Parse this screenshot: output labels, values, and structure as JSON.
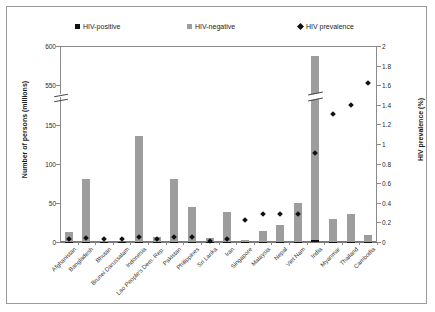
{
  "legend": [
    {
      "label": "HIV-positive",
      "marker": "square-black",
      "color": "#111111"
    },
    {
      "label": "HIV-negative",
      "marker": "square-grey",
      "color": "#9d9d9d"
    },
    {
      "label": "HIV prevalence",
      "marker": "diamond-black",
      "color": "#111111"
    }
  ],
  "axes": {
    "left_title": "Number of persons (millions)",
    "right_title": "HIV prevalence (%)",
    "left_ticks": [
      "0",
      "50",
      "100",
      "150",
      "550",
      "600"
    ],
    "right_ticks": [
      "0",
      "0.2",
      "0.4",
      "0.6",
      "0.8",
      "1",
      "1.2",
      "1.4",
      "1.6",
      "1.8",
      "2"
    ],
    "left_break_between": [
      "150",
      "550"
    ]
  },
  "chart_data": {
    "type": "bar",
    "title": "",
    "xlabel": "",
    "ylabel": "Number of persons (millions)",
    "y2label": "HIV prevalence (%)",
    "ylim": [
      0,
      600
    ],
    "y2lim": [
      0,
      2
    ],
    "y_axis_break": [
      150,
      550
    ],
    "grid": false,
    "legend_position": "top",
    "categories": [
      "Afghanistan",
      "Bangladesh",
      "Bhutan",
      "Brunei Darussalam",
      "Indonesia",
      "Lao People's Dem. Rep.",
      "Pakistan",
      "Philippines",
      "Sri Lanka",
      "Iran",
      "Singapore",
      "Malaysia",
      "Nepal",
      "Viet Nam",
      "India",
      "Myanmar",
      "Thailand",
      "Cambodia"
    ],
    "series": [
      {
        "name": "HIV-negative",
        "type": "bar",
        "color": "#9d9d9d",
        "axis": "left",
        "values": [
          13,
          80,
          1,
          0.4,
          135,
          6,
          80,
          45,
          5,
          39,
          2,
          14,
          22,
          50,
          585,
          29,
          35,
          9
        ]
      },
      {
        "name": "HIV-positive",
        "type": "bar",
        "color": "#111111",
        "axis": "left",
        "values": [
          0.1,
          0.2,
          0.01,
          0.01,
          0.3,
          0.02,
          0.2,
          0.1,
          0.01,
          0.1,
          0.01,
          0.1,
          0.1,
          0.3,
          2.4,
          0.3,
          0.5,
          0.1
        ]
      },
      {
        "name": "HIV prevalence",
        "type": "scatter",
        "color": "#111111",
        "axis": "right",
        "values": [
          0.03,
          0.04,
          0.03,
          0.03,
          0.05,
          0.03,
          0.05,
          0.05,
          0.01,
          0.03,
          0.22,
          0.29,
          0.29,
          0.29,
          0.91,
          1.31,
          1.4,
          1.62
        ]
      }
    ]
  }
}
